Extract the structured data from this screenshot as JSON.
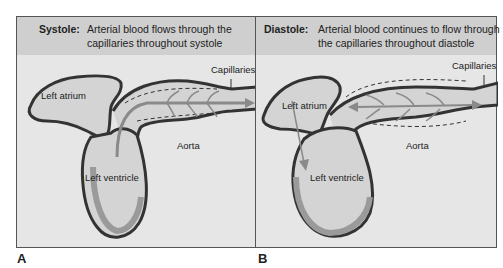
{
  "panels": [
    {
      "letter": "A",
      "phase": "Systole:",
      "caption_line1": "Arterial blood flows through the",
      "caption_line2": "capillaries throughout systole",
      "labels": {
        "capillaries": "Capillaries",
        "left_atrium": "Left atrium",
        "left_ventricle": "Left ventricle",
        "aorta": "Aorta"
      }
    },
    {
      "letter": "B",
      "phase": "Diastole:",
      "caption_line1": "Arterial blood continues to flow through",
      "caption_line2": "the capillaries throughout diastole",
      "labels": {
        "capillaries": "Capillaries",
        "left_atrium": "Left atrium",
        "left_ventricle": "Left ventricle",
        "aorta": "Aorta"
      }
    }
  ],
  "colors": {
    "panel_bg": "#e6e6e6",
    "header_bg": "#cfcfcf",
    "wall": "#9a9a9a",
    "outline": "#333333",
    "arrow": "#8a8a8a"
  }
}
